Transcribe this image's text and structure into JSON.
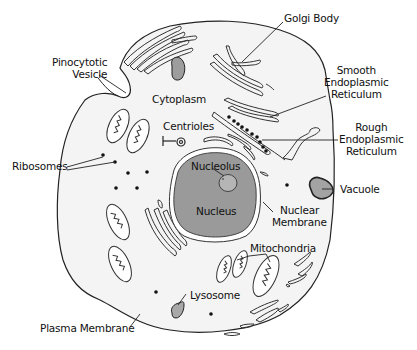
{
  "diagram": {
    "colors": {
      "cytoplasm": "#f4f4f4",
      "nucleus": "#9a9a9a",
      "nucleolus": "#b5b5b5",
      "vacuole": "#a3a3a3",
      "lysosome": "#a8a8a8",
      "outline": "#222222",
      "ribosome": "#111111"
    },
    "labels": {
      "golgi_body": "Golgi Body",
      "pinocytotic_vesicle": [
        "Pinocytotic",
        "Vesicle"
      ],
      "cytoplasm": "Cytoplasm",
      "smooth_er": [
        "Smooth",
        "Endoplasmic",
        "Reticulum"
      ],
      "rough_er": [
        "Rough",
        "Endoplasmic",
        "Reticulum"
      ],
      "centrioles": "Centrioles",
      "ribosomes": "Ribosomes",
      "nucleolus": "Nucleolus",
      "nucleus": "Nucleus",
      "vacuole": "Vacuole",
      "nuclear_membrane": [
        "Nuclear",
        "Membrane"
      ],
      "mitochondria": "Mitochondria",
      "lysosome": "Lysosome",
      "plasma_membrane": "Plasma Membrane"
    }
  }
}
